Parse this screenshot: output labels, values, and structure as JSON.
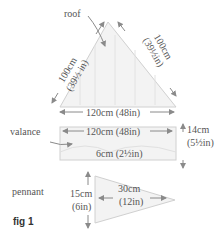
{
  "figure": {
    "caption": "fig 1",
    "colors": {
      "outline": "#c8c8c8",
      "fill": "#f3f3f3",
      "arrow": "#8a8a8a",
      "text": "#555555"
    }
  },
  "roof": {
    "label": "roof",
    "left_side": {
      "cm": "100cm",
      "in": "(39½ in)"
    },
    "right_side": {
      "cm": "100cm",
      "in": "(39½in)"
    },
    "base": "120cm (48in)"
  },
  "valance": {
    "label": "valance",
    "width": "120cm (48in)",
    "height": {
      "cm": "14cm",
      "in": "(5½in)"
    },
    "scallop": "6cm (2½in)"
  },
  "pennant": {
    "label": "pennant",
    "height": {
      "cm": "15cm",
      "in": "(6in)"
    },
    "length": {
      "cm": "30cm",
      "in": "(12in)"
    }
  }
}
